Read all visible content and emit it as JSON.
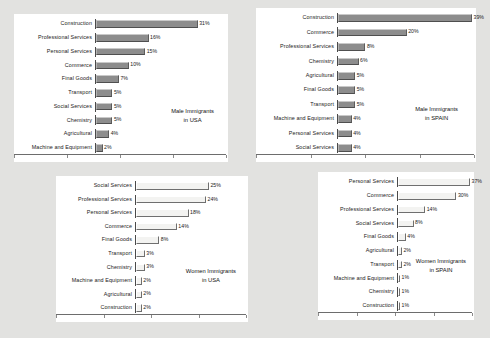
{
  "figure": {
    "background_color": "#e2e2e0",
    "panel_color": "#ffffff",
    "solid_bar_color": "#8d8d8d",
    "hollow_bar_color": "#f3f3f1",
    "axis_color": "#6d6d6d"
  },
  "chart_data": [
    {
      "id": "male-usa",
      "type": "bar",
      "orientation": "horizontal",
      "title": "Male Immigrants in USA",
      "caption_line1": "Male Immigrants",
      "caption_line2": "in USA",
      "xlabel": "",
      "ylabel": "",
      "xlim": [
        0,
        39
      ],
      "grid": false,
      "bar_style": "solid",
      "categories": [
        "Construction",
        "Professional Services",
        "Personal Services",
        "Commerce",
        "Final Goods",
        "Transport",
        "Social Services",
        "Chemistry",
        "Agricultural",
        "Machine and Equipment"
      ],
      "values": [
        31,
        16,
        15,
        10,
        7,
        5,
        5,
        5,
        4,
        2
      ],
      "value_labels": [
        "31%",
        "16%",
        "15%",
        "10%",
        "7%",
        "5%",
        "5%",
        "5%",
        "4%",
        "2%"
      ]
    },
    {
      "id": "male-spain",
      "type": "bar",
      "orientation": "horizontal",
      "title": "Male Immigrants in SPAIN",
      "caption_line1": "Male Immigrants",
      "caption_line2": "in SPAIN",
      "xlabel": "",
      "ylabel": "",
      "xlim": [
        0,
        39
      ],
      "grid": false,
      "bar_style": "solid",
      "categories": [
        "Construction",
        "Commerce",
        "Professional Services",
        "Chemistry",
        "Agricultural",
        "Final Goods",
        "Transport",
        "Machine and Equipment",
        "Personal Services",
        "Social Services"
      ],
      "values": [
        39,
        20,
        8,
        6,
        5,
        5,
        5,
        4,
        4,
        4
      ],
      "value_labels": [
        "39%",
        "20%",
        "8%",
        "6%",
        "5%",
        "5%",
        "5%",
        "4%",
        "4%",
        "4%"
      ]
    },
    {
      "id": "women-usa",
      "type": "bar",
      "orientation": "horizontal",
      "title": "Women Immigrants in USA",
      "caption_line1": "Women Immigrants",
      "caption_line2": "in USA",
      "xlabel": "",
      "ylabel": "",
      "xlim": [
        0,
        37
      ],
      "grid": false,
      "bar_style": "hollow",
      "categories": [
        "Social Services",
        "Professional Services",
        "Personal Services",
        "Commerce",
        "Final Goods",
        "Transport",
        "Chemistry",
        "Machine and Equipment",
        "Agricultural",
        "Construction"
      ],
      "values": [
        25,
        24,
        18,
        14,
        8,
        3,
        3,
        2,
        2,
        2
      ],
      "value_labels": [
        "25%",
        "24%",
        "18%",
        "14%",
        "8%",
        "3%",
        "3%",
        "2%",
        "2%",
        "2%"
      ]
    },
    {
      "id": "women-spain",
      "type": "bar",
      "orientation": "horizontal",
      "title": "Women Immigrants in SPAIN",
      "caption_line1": "Women Immigrants",
      "caption_line2": "in SPAIN",
      "xlabel": "",
      "ylabel": "",
      "xlim": [
        0,
        37
      ],
      "grid": false,
      "bar_style": "hollow",
      "categories": [
        "Personal Services",
        "Commerce",
        "Professional Services",
        "Social Services",
        "Final Goods",
        "Agricultural",
        "Transport",
        "Machine and Equipment",
        "Chemistry",
        "Construction"
      ],
      "values": [
        37,
        30,
        14,
        8,
        4,
        2,
        2,
        1,
        1,
        1
      ],
      "value_labels": [
        "37%",
        "30%",
        "14%",
        "8%",
        "4%",
        "2%",
        "2%",
        "1%",
        "1%",
        "1%"
      ]
    }
  ]
}
